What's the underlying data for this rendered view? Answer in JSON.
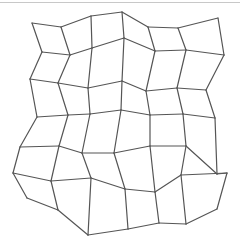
{
  "figure": {
    "type": "warped grid",
    "columns": 6,
    "rows": 7,
    "line_color": "#555555",
    "border_color": "#c8c8c8",
    "background": "#ffffff"
  },
  "mesh": {
    "vertices": [
      [
        [
          32,
          23
        ],
        [
          61,
          27
        ],
        [
          91,
          16
        ],
        [
          122,
          12
        ],
        [
          148,
          27
        ],
        [
          178,
          28
        ],
        [
          218,
          18
        ]
      ],
      [
        [
          42,
          52
        ],
        [
          70,
          55
        ],
        [
          92,
          48
        ],
        [
          124,
          38
        ],
        [
          155,
          51
        ],
        [
          186,
          50
        ],
        [
          224,
          55
        ]
      ],
      [
        [
          30,
          79
        ],
        [
          58,
          83
        ],
        [
          88,
          88
        ],
        [
          122,
          81
        ],
        [
          146,
          91
        ],
        [
          177,
          88
        ],
        [
          206,
          90
        ]
      ],
      [
        [
          37,
          117
        ],
        [
          68,
          115
        ],
        [
          90,
          114
        ],
        [
          121,
          110
        ],
        [
          150,
          115
        ],
        [
          183,
          114
        ],
        [
          215,
          118
        ]
      ],
      [
        [
          20,
          147
        ],
        [
          59,
          146
        ],
        [
          82,
          153
        ],
        [
          114,
          153
        ],
        [
          150,
          146
        ],
        [
          186,
          146
        ],
        [
          217,
          174
        ]
      ],
      [
        [
          13,
          173
        ],
        [
          51,
          181
        ],
        [
          91,
          178
        ],
        [
          125,
          189
        ],
        [
          155,
          192
        ],
        [
          181,
          175
        ],
        [
          227,
          173
        ]
      ],
      [
        [
          27,
          198
        ],
        [
          58,
          210
        ],
        [
          88,
          235
        ],
        [
          128,
          229
        ],
        [
          159,
          223
        ],
        [
          186,
          224
        ],
        [
          217,
          209
        ]
      ]
    ]
  }
}
